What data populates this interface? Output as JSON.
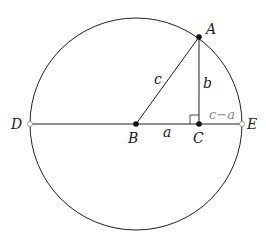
{
  "diagram": {
    "type": "geometry",
    "circle": {
      "center": "B",
      "cx": 136,
      "cy": 124,
      "r": 106
    },
    "points": {
      "A": {
        "label": "A",
        "x": 199,
        "y": 37,
        "style": "filled"
      },
      "B": {
        "label": "B",
        "x": 136,
        "y": 124,
        "style": "filled"
      },
      "C": {
        "label": "C",
        "x": 199,
        "y": 124,
        "style": "filled"
      },
      "D": {
        "label": "D",
        "x": 30,
        "y": 124,
        "style": "hollow"
      },
      "E": {
        "label": "E",
        "x": 242,
        "y": 124,
        "style": "hollow"
      }
    },
    "segments": {
      "c": {
        "label": "c",
        "from": "B",
        "to": "A"
      },
      "b": {
        "label": "b",
        "from": "C",
        "to": "A"
      },
      "a": {
        "label": "a",
        "from": "B",
        "to": "C"
      },
      "cma": {
        "label": "c−a",
        "from": "C",
        "to": "E"
      }
    },
    "right_angle_at": "C",
    "colors": {
      "line": "#222222",
      "muted_label": "#888888",
      "hollow_point": "#999999"
    }
  }
}
